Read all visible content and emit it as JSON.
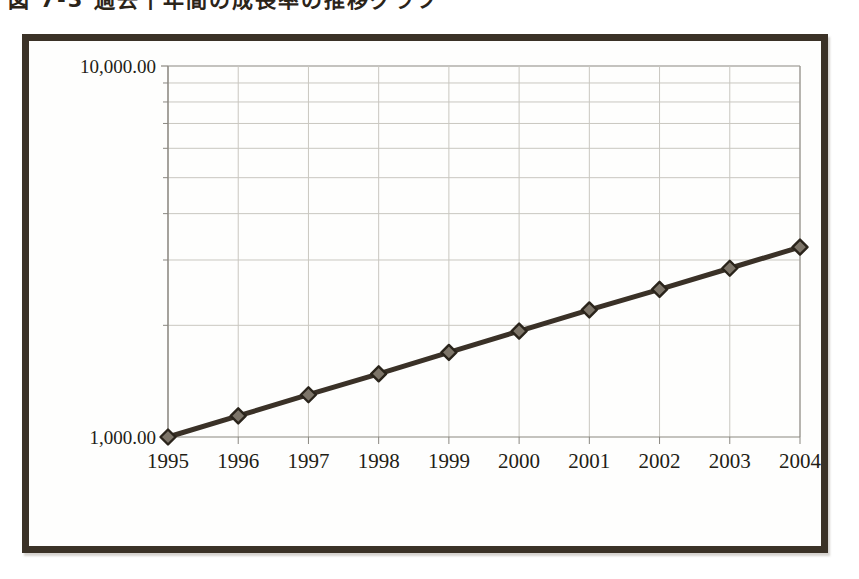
{
  "caption": {
    "text": "図 7-3  過去十年間の成長率の推移グラフ"
  },
  "colors": {
    "frame": "#3b3227",
    "line": "#3a3127",
    "marker_fill": "#7d7569",
    "marker_stroke": "#2a241b",
    "grid": "#c9c7c0",
    "axis": "#8a8780",
    "text": "#231d15",
    "background": "#fefefd"
  },
  "chart_data": {
    "type": "line",
    "title": "",
    "subtitle": "",
    "xlabel": "",
    "ylabel": "",
    "yscale": "log",
    "ylim": [
      1000,
      10000
    ],
    "grid": true,
    "legend": "none",
    "y_tick_labels": [
      "10,000.00",
      "1,000.00"
    ],
    "y_minor_gridlines": [
      2000,
      3000,
      4000,
      5000,
      6000,
      7000,
      8000,
      9000
    ],
    "categories": [
      "1995",
      "1996",
      "1997",
      "1998",
      "1999",
      "2000",
      "2001",
      "2002",
      "2003",
      "2004"
    ],
    "x": [
      1995,
      1996,
      1997,
      1998,
      1999,
      2000,
      2001,
      2002,
      2003,
      2004
    ],
    "series": [
      {
        "name": "成長率",
        "marker": "diamond",
        "values": [
          1000,
          1140,
          1300,
          1480,
          1690,
          1930,
          2200,
          2500,
          2850,
          3250
        ]
      }
    ],
    "annotations": []
  },
  "axis": {
    "y_top_label": "10,000.00",
    "y_bottom_label": "1,000.00"
  }
}
